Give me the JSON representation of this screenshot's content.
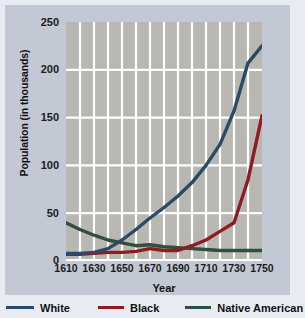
{
  "chart_data": {
    "type": "line",
    "title": "",
    "xlabel": "Year",
    "ylabel": "Population (in thousands)",
    "xlim": [
      1610,
      1750
    ],
    "ylim": [
      0,
      250
    ],
    "xticks": [
      "1610",
      "1630",
      "1650",
      "1670",
      "1690",
      "1710",
      "1730",
      "1750"
    ],
    "yticks": [
      "0",
      "50",
      "100",
      "150",
      "200",
      "250"
    ],
    "grid": "vertical and horizontal white gridlines on gray plot background",
    "legend_position": "below plot, horizontal",
    "x": [
      1610,
      1620,
      1630,
      1640,
      1650,
      1660,
      1670,
      1680,
      1690,
      1700,
      1710,
      1720,
      1730,
      1740,
      1750
    ],
    "series": [
      {
        "name": "White",
        "color": "#2b4a66",
        "values": [
          8,
          8,
          9,
          13,
          22,
          33,
          45,
          56,
          68,
          82,
          100,
          122,
          157,
          207,
          225
        ]
      },
      {
        "name": "Black",
        "color": "#8e1c20",
        "values": [
          7,
          7,
          8,
          9,
          9,
          10,
          13,
          11,
          11,
          16,
          22,
          31,
          40,
          85,
          152
        ]
      },
      {
        "name": "Native American",
        "color": "#2f4f41",
        "values": [
          40,
          33,
          27,
          22,
          19,
          16,
          17,
          15,
          14,
          13,
          12,
          11,
          11,
          11,
          11
        ]
      }
    ]
  },
  "legend": {
    "items": [
      {
        "label": "White",
        "color": "#2b4a66"
      },
      {
        "label": "Black",
        "color": "#8e1c20"
      },
      {
        "label": "Native American",
        "color": "#2f4f41"
      }
    ]
  },
  "colors": {
    "page_background": "#e8ecf2",
    "card_background": "#c3c9d4",
    "plot_background": "#b9b7b2",
    "gridline": "#ffffff",
    "text": "#111111"
  }
}
